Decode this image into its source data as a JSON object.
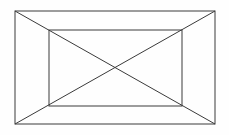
{
  "figure": {
    "title": "Nested rectangles with crossing diagonals",
    "background_color": "#fefefe",
    "stroke_color": "#3a3a3a",
    "stroke_width": 1,
    "canvas": {
      "width": 229,
      "height": 135
    },
    "shapes": [
      {
        "name": "outer-rectangle",
        "type": "rect",
        "x": 15,
        "y": 11,
        "width": 200,
        "height": 113,
        "corners": [
          [
            15,
            11
          ],
          [
            215,
            11
          ],
          [
            215,
            124
          ],
          [
            15,
            124
          ]
        ]
      },
      {
        "name": "inner-rectangle",
        "type": "rect",
        "x": 49,
        "y": 30,
        "width": 133,
        "height": 76,
        "corners": [
          [
            49,
            30
          ],
          [
            182,
            30
          ],
          [
            182,
            106
          ],
          [
            49,
            106
          ]
        ]
      },
      {
        "name": "diagonal-top-left-to-bottom-right",
        "type": "line",
        "x1": 15,
        "y1": 11,
        "x2": 215,
        "y2": 124
      },
      {
        "name": "diagonal-top-right-to-bottom-left",
        "type": "line",
        "x1": 215,
        "y1": 11,
        "x2": 15,
        "y2": 124
      }
    ],
    "intersection_point": {
      "x": 115,
      "y": 67.5
    }
  }
}
